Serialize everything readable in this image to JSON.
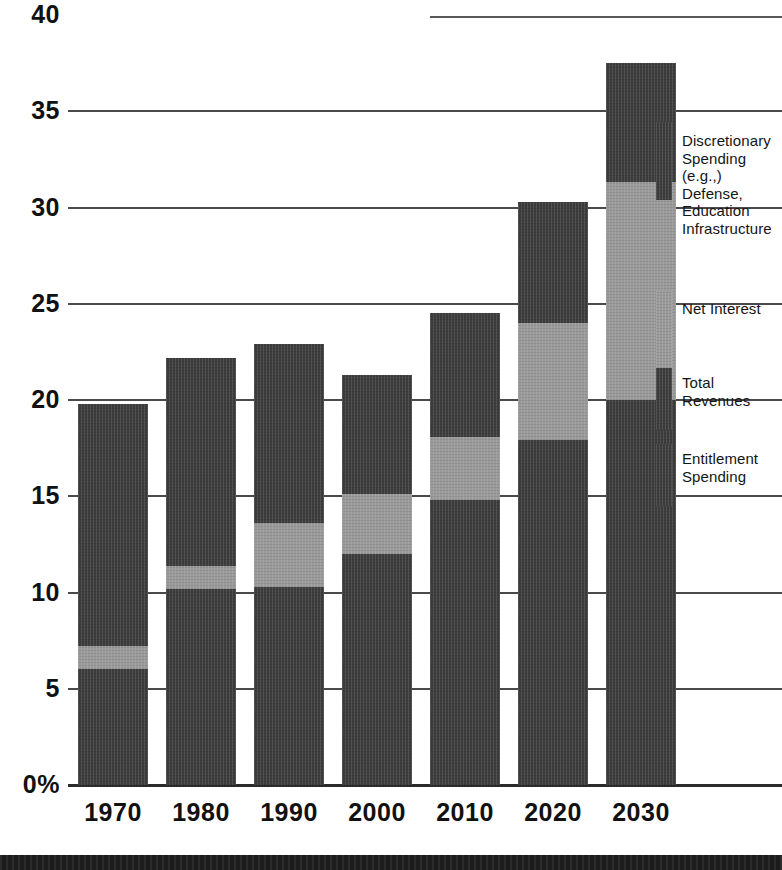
{
  "chart_data": {
    "type": "bar",
    "stacked": true,
    "title": "",
    "subtitle": "",
    "xlabel": "",
    "ylabel": "",
    "categories": [
      "1970",
      "1980",
      "1990",
      "2000",
      "2010",
      "2020",
      "2030"
    ],
    "ylim": [
      0,
      40
    ],
    "yticks": [
      "0%",
      "5",
      "10",
      "15",
      "20",
      "25",
      "30",
      "35",
      "40"
    ],
    "ytick_values": [
      0,
      5,
      10,
      15,
      20,
      25,
      30,
      35,
      40
    ],
    "grid": true,
    "grid_axis": "y",
    "legend_position": "right",
    "series": [
      {
        "name": "Entitlement Spending",
        "color": "#3d3d3d",
        "values": [
          6.0,
          10.2,
          10.3,
          12.0,
          14.8,
          17.9,
          20.0
        ]
      },
      {
        "name": "Net Interest",
        "color": "#9a9a9a",
        "values": [
          1.2,
          1.2,
          3.3,
          3.1,
          3.3,
          6.1,
          11.3
        ]
      },
      {
        "name": "Discretionary Spending (e.g., Defense, Education Infrastructure",
        "color": "#3d3d3d",
        "values": [
          12.6,
          10.8,
          9.3,
          6.2,
          6.4,
          6.3,
          6.2
        ]
      }
    ],
    "totals": [
      19.8,
      22.2,
      22.9,
      21.3,
      24.5,
      30.3,
      37.5
    ],
    "annotations": []
  },
  "axes": {
    "y_ticks": [
      "40",
      "35",
      "30",
      "25",
      "20",
      "15",
      "10",
      "5",
      "0%"
    ],
    "x_ticks": [
      "1970",
      "1980",
      "1990",
      "2000",
      "2010",
      "2020",
      "2030"
    ]
  },
  "legend": {
    "items": [
      {
        "label": "Discretionary\nSpending (e.g.,)\nDefense,\nEducation\nInfrastructure",
        "color": "#3d3d3d",
        "swatch": "dark"
      },
      {
        "label": "Net Interest",
        "color": "#9a9a9a",
        "swatch": "light"
      },
      {
        "label": "Total Revenues",
        "color": "#3d3d3d",
        "swatch": "dark"
      },
      {
        "label": "Entitlement\nSpending",
        "color": "#3d3d3d",
        "swatch": "dark"
      }
    ]
  },
  "colors": {
    "dark": "#3d3d3d",
    "light": "#9a9a9a",
    "grid": "#4a4a4a",
    "axis": "#2b2b2b",
    "text": "#111111",
    "band": "#1c1c1c"
  }
}
